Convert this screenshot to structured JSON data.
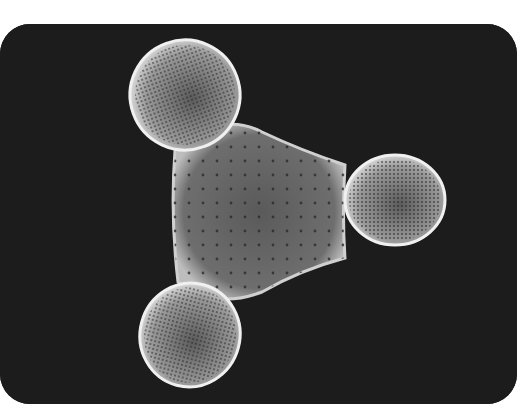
{
  "image": {
    "subject": "Triradiate diatom (SEM micrograph)",
    "background_color": "#1c1c1c",
    "frame_color": "#ffffff",
    "specimen_tone": "#8a8a8a",
    "lobes": 3
  }
}
